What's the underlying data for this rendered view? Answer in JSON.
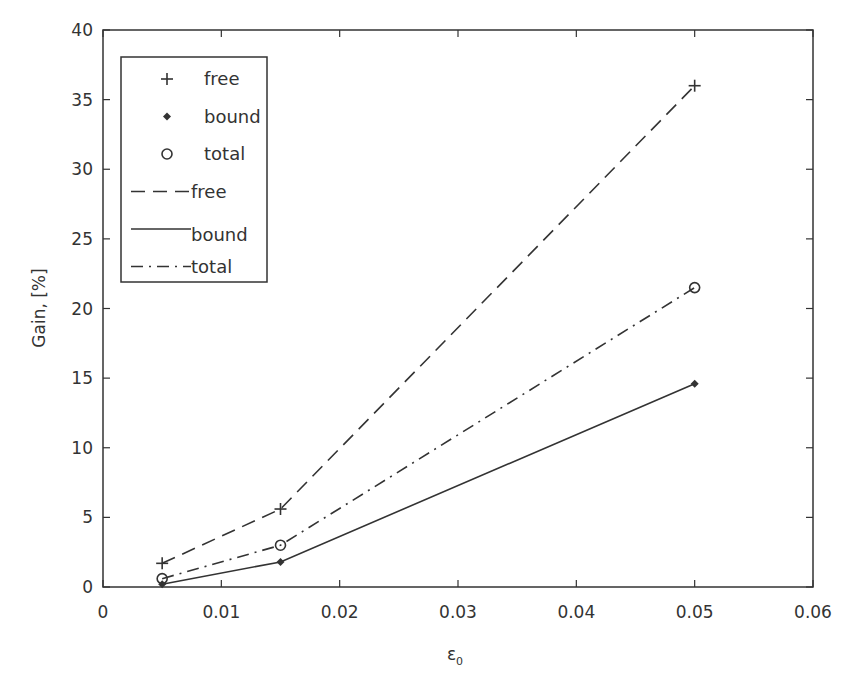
{
  "chart_data": {
    "type": "line",
    "title": "",
    "xlabel": "ε",
    "xlabel_subscript": "0",
    "ylabel": "Gain, [%]",
    "xlim": [
      0,
      0.06
    ],
    "ylim": [
      0,
      40
    ],
    "x_ticks": [
      0,
      0.01,
      0.02,
      0.03,
      0.04,
      0.05,
      0.06
    ],
    "x_tick_labels": [
      "0",
      "0.01",
      "0.02",
      "0.03",
      "0.04",
      "0.05",
      "0.06"
    ],
    "y_ticks": [
      0,
      5,
      10,
      15,
      20,
      25,
      30,
      35,
      40
    ],
    "y_tick_labels": [
      "0",
      "5",
      "10",
      "15",
      "20",
      "25",
      "30",
      "35",
      "40"
    ],
    "grid": false,
    "legend_position": "upper left",
    "x": [
      0.005,
      0.015,
      0.05
    ],
    "series": [
      {
        "name": "free",
        "kind": "marker",
        "marker": "+",
        "values": [
          1.7,
          5.6,
          36.0
        ]
      },
      {
        "name": "bound",
        "kind": "marker",
        "marker": "diamond",
        "values": [
          0.2,
          1.8,
          14.6
        ]
      },
      {
        "name": "total",
        "kind": "marker",
        "marker": "circle",
        "values": [
          0.6,
          3.0,
          21.5
        ]
      },
      {
        "name": "free",
        "kind": "line",
        "style": "dashed",
        "values": [
          1.7,
          5.6,
          36.0
        ]
      },
      {
        "name": "bound",
        "kind": "line",
        "style": "solid",
        "values": [
          0.2,
          1.8,
          14.6
        ]
      },
      {
        "name": "total",
        "kind": "line",
        "style": "dashdot",
        "values": [
          0.6,
          3.0,
          21.5
        ]
      }
    ],
    "legend": [
      "free",
      "bound",
      "total",
      "free",
      "bound",
      "total"
    ]
  },
  "colors": {
    "axis": "#333333",
    "series": "#333333"
  }
}
